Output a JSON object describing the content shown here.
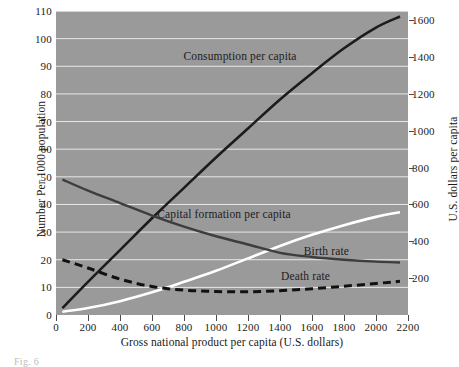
{
  "figure": {
    "caption_fragment": "Fig. 6",
    "background_color": "#9a9a9a",
    "gridline_color": "#e8e8e8"
  },
  "chart_data": {
    "type": "line",
    "title": "",
    "subtitle": "",
    "xlabel": "Gross national product per capita (U.S. dollars)",
    "ylabel": "Number Per 1000 population",
    "ylabel_right": "U.S. dollars per capita",
    "xlim": [
      0,
      2200
    ],
    "ylim": [
      0,
      110
    ],
    "ylim_right": [
      0,
      1650
    ],
    "xticks": [
      0,
      200,
      400,
      600,
      800,
      1000,
      1200,
      1400,
      1600,
      1800,
      2000,
      2200
    ],
    "yticks": [
      0,
      10,
      20,
      30,
      40,
      50,
      60,
      70,
      80,
      90,
      100,
      110
    ],
    "yticks_right": [
      200,
      400,
      600,
      800,
      1000,
      1200,
      1400,
      1600
    ],
    "grid": true,
    "grid_axis": "y",
    "legend": "inline-annotations",
    "series": [
      {
        "name": "Consumption per capita",
        "axis": "right",
        "style": "solid",
        "color": "#1c1c1c",
        "width": 2.6,
        "label_x": 1150,
        "label_y": 93,
        "x": [
          40,
          200,
          400,
          600,
          800,
          1000,
          1200,
          1400,
          1600,
          1800,
          2000,
          2150
        ],
        "values": [
          2.5,
          12,
          23.5,
          35,
          46,
          57,
          67.5,
          78,
          87.5,
          96.5,
          104,
          108
        ]
      },
      {
        "name": "Capital formation per capita",
        "axis": "right",
        "style": "solid",
        "color": "#ffffff",
        "width": 2.6,
        "label_x": 1050,
        "label_y": 36,
        "x": [
          40,
          200,
          400,
          600,
          800,
          1000,
          1200,
          1400,
          1600,
          1800,
          2000,
          2150
        ],
        "values": [
          1.2,
          2.5,
          5,
          8.2,
          12,
          16,
          20.5,
          25,
          29,
          32.5,
          35.5,
          37.2
        ]
      },
      {
        "name": "Birth rate",
        "axis": "left",
        "style": "solid",
        "color": "#3d3d3d",
        "width": 2.4,
        "label_x": 1690,
        "label_y": 22.5,
        "x": [
          40,
          200,
          400,
          600,
          800,
          1000,
          1200,
          1400,
          1600,
          1800,
          2000,
          2150
        ],
        "values": [
          49,
          45,
          40.5,
          36,
          32,
          28.5,
          25.5,
          22.5,
          21,
          20,
          19.3,
          19
        ]
      },
      {
        "name": "Death rate",
        "axis": "left",
        "style": "dashed",
        "color": "#111111",
        "width": 3.0,
        "label_x": 1560,
        "label_y": 13.5,
        "x": [
          40,
          200,
          400,
          600,
          800,
          1000,
          1200,
          1400,
          1600,
          1800,
          2000,
          2150
        ],
        "values": [
          20,
          17,
          13,
          10.3,
          9,
          8.5,
          8.4,
          8.8,
          9.5,
          10.4,
          11.4,
          12.2
        ]
      }
    ]
  }
}
